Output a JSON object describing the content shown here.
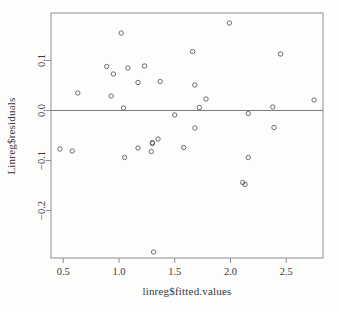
{
  "window": {
    "background": "#fdfdfc"
  },
  "chart_data": {
    "type": "scatter",
    "title": "",
    "xlabel": "linreg$fitted.values",
    "ylabel": "Linreg$residuals",
    "xlim": [
      0.39,
      2.83
    ],
    "ylim": [
      -0.295,
      0.195
    ],
    "x_ticks": [
      0.5,
      1.0,
      1.5,
      2.0,
      2.5
    ],
    "x_tick_labels": [
      "0.5",
      "1.0",
      "1.5",
      "2.0",
      "2.5"
    ],
    "y_ticks": [
      0.1,
      0.0,
      -0.1,
      -0.2
    ],
    "y_tick_labels": [
      "0.1",
      "0.0",
      "−0.1",
      "−0.2"
    ],
    "reference_line_y": 0.0,
    "grid": false,
    "legend": false,
    "marker": "open-circle",
    "colors": {
      "box": "#8f8f8f",
      "zero_line": "#6e6e6e",
      "point_stroke": "#5f5f5f",
      "axis_text": "#383838",
      "background": "#fdfdfc"
    },
    "points": [
      [
        1.02,
        0.155
      ],
      [
        1.99,
        0.175
      ],
      [
        0.89,
        0.088
      ],
      [
        0.95,
        0.073
      ],
      [
        1.08,
        0.085
      ],
      [
        1.23,
        0.089
      ],
      [
        1.17,
        0.056
      ],
      [
        1.37,
        0.058
      ],
      [
        0.63,
        0.035
      ],
      [
        0.93,
        0.029
      ],
      [
        1.04,
        0.005
      ],
      [
        1.5,
        -0.009
      ],
      [
        1.66,
        0.118
      ],
      [
        2.45,
        0.113
      ],
      [
        1.68,
        0.051
      ],
      [
        1.78,
        0.023
      ],
      [
        1.72,
        0.006
      ],
      [
        2.75,
        0.021
      ],
      [
        2.38,
        0.007
      ],
      [
        2.16,
        -0.006
      ],
      [
        1.68,
        -0.035
      ],
      [
        2.39,
        -0.034
      ],
      [
        1.58,
        -0.074
      ],
      [
        0.47,
        -0.077
      ],
      [
        0.58,
        -0.081
      ],
      [
        1.05,
        -0.094
      ],
      [
        1.17,
        -0.075
      ],
      [
        1.29,
        -0.082
      ],
      [
        1.3,
        -0.064
      ],
      [
        1.3,
        -0.066
      ],
      [
        1.35,
        -0.057
      ],
      [
        2.16,
        -0.094
      ],
      [
        2.11,
        -0.144
      ],
      [
        2.13,
        -0.148
      ],
      [
        1.31,
        -0.283
      ]
    ]
  }
}
